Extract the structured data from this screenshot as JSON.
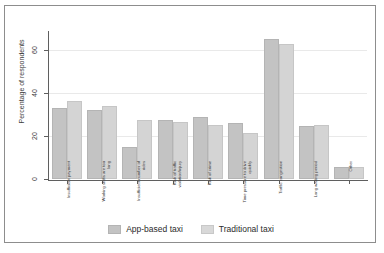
{
  "chart_data": {
    "type": "bar",
    "title": "",
    "xlabel": "",
    "ylabel": "Percentage of respondents",
    "ylim": [
      0,
      68
    ],
    "yticks": [
      0,
      20,
      40,
      60
    ],
    "grid": true,
    "legend_position": "bottom",
    "categories": [
      "Insufficient payment",
      "Working shifts are too long",
      "Insufficient number of rides",
      "Risk of traffic violation/injury",
      "Risk of crime",
      "Time pressure to drive quickly",
      "Traffic congestion",
      "Long waiting period",
      "Other"
    ],
    "series": [
      {
        "name": "App-based taxi",
        "color": "#c3c3c3",
        "values": [
          33,
          32,
          15,
          27.5,
          29,
          26,
          65,
          24.5,
          5.5
        ]
      },
      {
        "name": "Traditional taxi",
        "color": "#d8d8d8",
        "values": [
          36.5,
          34,
          27.5,
          26.5,
          25,
          21.5,
          63,
          25,
          5.5
        ]
      }
    ]
  },
  "legend": {
    "entries": [
      {
        "label": "App-based taxi"
      },
      {
        "label": "Traditional taxi"
      }
    ]
  },
  "caption": ""
}
